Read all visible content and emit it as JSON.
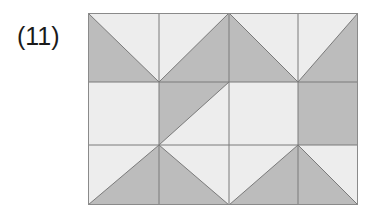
{
  "figure": {
    "label": "(11)",
    "caption_position": "left"
  },
  "canvas": {
    "width": 389,
    "height": 218,
    "background": "#ffffff"
  },
  "palette": {
    "light_fill": "#ededed",
    "dark_fill": "#bcbcbc",
    "line_color": "#7a7a7a",
    "outer_border": "#8a8a8a",
    "label_color": "#1a1a1a"
  },
  "pattern": {
    "name": "half-square-triangle-tiling",
    "columns": 4,
    "rows": 3,
    "cell_width": 67.5,
    "cell_height": 64,
    "origin_x": 88,
    "origin_y": 13,
    "width": 270,
    "height": 192,
    "column_edges": [
      88,
      159,
      229,
      298,
      358
    ],
    "row_edges": [
      13,
      82,
      145,
      205
    ],
    "cells": [
      {
        "row": 0,
        "col": 0,
        "type": "diagonal",
        "diagonal": "tl-br",
        "dark_side": "lower-left"
      },
      {
        "row": 0,
        "col": 1,
        "type": "diagonal",
        "diagonal": "tr-bl",
        "dark_side": "lower-right"
      },
      {
        "row": 0,
        "col": 2,
        "type": "diagonal",
        "diagonal": "tl-br",
        "dark_side": "lower-left"
      },
      {
        "row": 0,
        "col": 3,
        "type": "diagonal",
        "diagonal": "tr-bl",
        "dark_side": "lower-right"
      },
      {
        "row": 1,
        "col": 0,
        "type": "solid",
        "diagonal": "none",
        "dark_side": "none"
      },
      {
        "row": 1,
        "col": 1,
        "type": "diagonal",
        "diagonal": "tr-bl",
        "dark_side": "upper-left"
      },
      {
        "row": 1,
        "col": 2,
        "type": "solid",
        "diagonal": "none",
        "dark_side": "none"
      },
      {
        "row": 1,
        "col": 3,
        "type": "solid",
        "diagonal": "none",
        "dark_side": "all"
      },
      {
        "row": 2,
        "col": 0,
        "type": "diagonal",
        "diagonal": "tr-bl",
        "dark_side": "lower-right"
      },
      {
        "row": 2,
        "col": 1,
        "type": "diagonal",
        "diagonal": "tl-br",
        "dark_side": "lower-left"
      },
      {
        "row": 2,
        "col": 2,
        "type": "diagonal",
        "diagonal": "tr-bl",
        "dark_side": "lower-right"
      },
      {
        "row": 2,
        "col": 3,
        "type": "diagonal",
        "diagonal": "tl-br",
        "dark_side": "lower-left"
      }
    ]
  }
}
